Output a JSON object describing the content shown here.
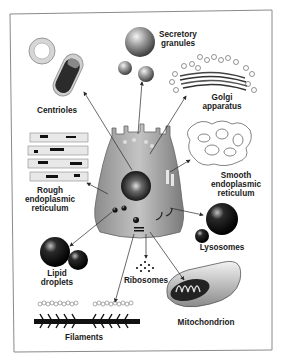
{
  "diagram": {
    "title": "",
    "center": "Cell",
    "colors": {
      "frame": "#8a8a8a",
      "label": "#1a1a1a",
      "cell_fill": "#a9a9a9",
      "arrow": "#2a2a2a"
    },
    "labels": {
      "centrioles": "Centrioles",
      "secretory_1": "Secretory",
      "secretory_2": "granules",
      "golgi_1": "Golgi",
      "golgi_2": "apparatus",
      "rough_1": "Rough",
      "rough_2": "endoplasmic",
      "rough_3": "reticulum",
      "smooth_1": "Smooth",
      "smooth_2": "endoplasmic",
      "smooth_3": "reticulum",
      "lysosomes": "Lysosomes",
      "lipid_1": "Lipid",
      "lipid_2": "droplets",
      "ribosomes": "Ribosomes",
      "mitochondrion": "Mitochondrion",
      "filaments": "Filaments"
    },
    "organelles": [
      "Centrioles",
      "Secretory granules",
      "Golgi apparatus",
      "Rough endoplasmic reticulum",
      "Smooth endoplasmic reticulum",
      "Lysosomes",
      "Lipid droplets",
      "Ribosomes",
      "Mitochondrion",
      "Filaments"
    ]
  }
}
